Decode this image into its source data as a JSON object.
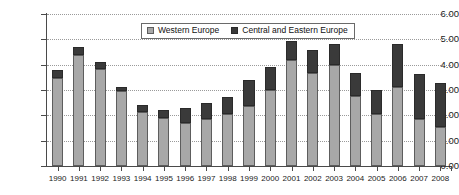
{
  "chart_data": {
    "type": "bar",
    "stacked": true,
    "title": "",
    "subtitle": "",
    "xlabel": "",
    "ylabel": "",
    "ylim": [
      0,
      6
    ],
    "ytick_values": [
      0,
      1,
      2,
      3,
      4,
      5,
      6
    ],
    "ytick_labels": [
      "0.00",
      "1.00",
      "2.00",
      "3.00",
      "4.00",
      "5.00",
      "6.00"
    ],
    "grid": true,
    "grid_axis": "y",
    "legend_position": "top-center",
    "categories": [
      "1990",
      "1991",
      "1992",
      "1993",
      "1994",
      "1995",
      "1996",
      "1997",
      "1998",
      "1999",
      "2000",
      "2001",
      "2002",
      "2003",
      "2004",
      "2005",
      "2006",
      "2007",
      "2008"
    ],
    "series": [
      {
        "name": "Western Europe",
        "color": "#a8a8a8",
        "values": [
          3.48,
          4.37,
          3.82,
          2.95,
          2.12,
          1.88,
          1.68,
          1.84,
          2.06,
          2.38,
          3.0,
          4.18,
          3.67,
          3.97,
          2.77,
          2.04,
          3.1,
          1.85,
          1.55
        ]
      },
      {
        "name": "Central and Eastern Europe",
        "color": "#3a3a3a",
        "values": [
          0.29,
          0.32,
          0.3,
          0.18,
          0.28,
          0.35,
          0.6,
          0.66,
          0.68,
          1.02,
          0.92,
          0.75,
          0.92,
          0.83,
          0.91,
          0.95,
          1.7,
          1.79,
          1.74
        ]
      }
    ],
    "totals": [
      3.77,
      4.69,
      4.12,
      3.13,
      2.4,
      2.23,
      2.28,
      2.5,
      2.74,
      3.4,
      3.92,
      4.93,
      4.59,
      4.8,
      3.68,
      2.99,
      4.8,
      3.64,
      3.29
    ]
  },
  "legend": {
    "entries": [
      {
        "label": "Western Europe",
        "swatch": "legend-swatch-western-europe"
      },
      {
        "label": "Central and Eastern Europe",
        "swatch": "legend-swatch-central-eastern-europe"
      }
    ]
  }
}
